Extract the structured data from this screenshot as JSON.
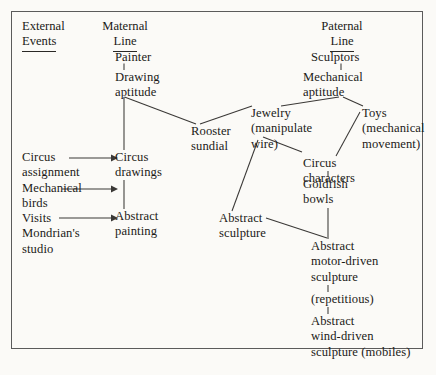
{
  "diagram": {
    "title_frame": "genealogical influence diagram",
    "columns": [
      {
        "id": "external",
        "label_line1": "External",
        "label_line2": "Events",
        "align": "left"
      },
      {
        "id": "maternal",
        "label_line1": "Maternal",
        "label_line2": "Line",
        "align": "center"
      },
      {
        "id": "paternal",
        "label_line1": "Paternal",
        "label_line2": "Line",
        "align": "center"
      }
    ],
    "external_events": [
      {
        "id": "circus-assignment",
        "text": "Circus\nassignment",
        "arrow": "right"
      },
      {
        "id": "mechanical-birds",
        "text": "Mechanical\nbirds",
        "arrow": "right"
      },
      {
        "id": "visits-mondrians-studio",
        "text": "Visits\nMondrian's\nstudio",
        "arrow": "right"
      }
    ],
    "maternal_nodes": [
      {
        "id": "painter",
        "text": "Painter"
      },
      {
        "id": "drawing-aptitude",
        "text": "Drawing\naptitude"
      },
      {
        "id": "circus-drawings",
        "text": "Circus\ndrawings"
      },
      {
        "id": "abstract-painting",
        "text": "Abstract\npainting"
      }
    ],
    "middle_nodes": [
      {
        "id": "rooster-sundial",
        "text": "Rooster\nsundial"
      },
      {
        "id": "abstract-sculpture",
        "text": "Abstract\nsculpture"
      }
    ],
    "paternal_nodes": [
      {
        "id": "sculptors",
        "text": "Sculptors"
      },
      {
        "id": "mechanical-aptitude",
        "text": "Mechanical\naptitude"
      },
      {
        "id": "jewelry",
        "text": "Jewelry\n(manipulate\nwire)"
      },
      {
        "id": "toys",
        "text": "Toys\n(mechanical\nmovement)"
      },
      {
        "id": "circus-characters",
        "text": "Circus\ncharacters"
      },
      {
        "id": "goldfish-bowls",
        "text": "Goldfish\nbowls"
      },
      {
        "id": "abstract-motor-driven-sculpture",
        "text": "Abstract\nmotor-driven\nsculpture"
      },
      {
        "id": "repetitious",
        "text": "(repetitious)"
      },
      {
        "id": "abstract-wind-driven-sculpture",
        "text": "Abstract\nwind-driven\nsculpture (mobiles)"
      }
    ],
    "colors": {
      "ink": "#1c1a18",
      "line": "#3a3836",
      "frame": "#5b5b5b",
      "paper": "#fbfaf7"
    }
  }
}
